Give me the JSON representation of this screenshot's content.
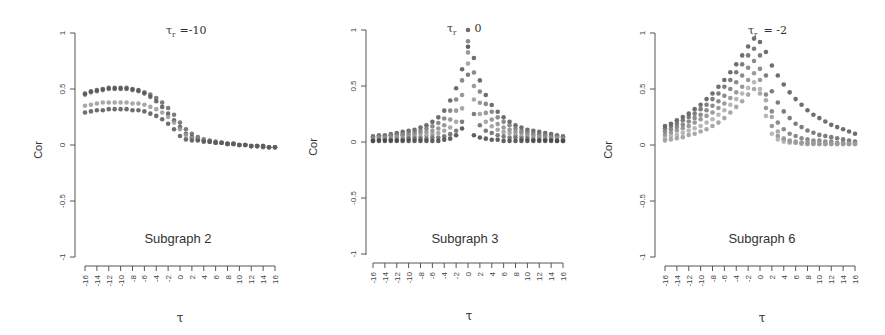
{
  "chart_data": [
    {
      "type": "scatter",
      "title": "τ_r = -10",
      "title_symbol": "τ",
      "title_subscript": "r",
      "title_value": "=-10",
      "subtitle": "Subgraph 2",
      "xlabel": "τ",
      "ylabel": "Cor",
      "xlim": [
        -16,
        16
      ],
      "ylim": [
        -1,
        1
      ],
      "x_ticks": [
        -16,
        -14,
        -12,
        -10,
        -8,
        -6,
        -4,
        -2,
        0,
        2,
        4,
        6,
        8,
        10,
        12,
        14,
        16
      ],
      "y_ticks": [
        -1,
        -0.5,
        0,
        0.5,
        1
      ],
      "y_tick_labels": [
        "-1",
        "-0.5",
        "0",
        "0.5",
        "1"
      ],
      "grid": false,
      "x": [
        -16,
        -15,
        -14,
        -13,
        -12,
        -11,
        -10,
        -9,
        -8,
        -7,
        -6,
        -5,
        -4,
        -3,
        -2,
        -1,
        0,
        1,
        2,
        3,
        4,
        5,
        6,
        7,
        8,
        9,
        10,
        11,
        12,
        13,
        14,
        15,
        16
      ],
      "series": [
        {
          "name": "upper",
          "color": "#666666",
          "values": [
            0.45,
            0.47,
            0.48,
            0.49,
            0.5,
            0.5,
            0.5,
            0.5,
            0.49,
            0.48,
            0.47,
            0.45,
            0.42,
            0.38,
            0.33,
            0.27,
            0.2,
            0.14,
            0.1,
            0.07,
            0.05,
            0.04,
            0.03,
            0.02,
            0.01,
            0.01,
            0.0,
            0.0,
            -0.01,
            -0.01,
            -0.01,
            -0.02,
            -0.02
          ]
        },
        {
          "name": "upper-2",
          "color": "#555555",
          "values": [
            0.46,
            0.48,
            0.49,
            0.5,
            0.51,
            0.51,
            0.51,
            0.51,
            0.5,
            0.49,
            0.46,
            0.43,
            0.39,
            0.34,
            0.28,
            0.22,
            0.16,
            0.1,
            0.07,
            0.05,
            0.04,
            0.03,
            0.02,
            0.02,
            0.01,
            0.01,
            0.0,
            0.0,
            -0.01,
            -0.01,
            -0.02,
            -0.02,
            -0.02
          ]
        },
        {
          "name": "middle",
          "color": "#999999",
          "values": [
            0.35,
            0.36,
            0.37,
            0.38,
            0.38,
            0.38,
            0.38,
            0.38,
            0.37,
            0.37,
            0.36,
            0.34,
            0.32,
            0.29,
            0.25,
            0.2,
            0.14,
            0.09,
            0.06,
            0.05,
            0.04,
            0.03,
            0.02,
            0.02,
            0.01,
            0.01,
            0.0,
            0.0,
            -0.01,
            -0.01,
            -0.01,
            -0.02,
            -0.02
          ]
        },
        {
          "name": "lower",
          "color": "#555555",
          "values": [
            0.29,
            0.3,
            0.31,
            0.31,
            0.32,
            0.32,
            0.32,
            0.32,
            0.31,
            0.31,
            0.3,
            0.28,
            0.26,
            0.23,
            0.19,
            0.14,
            0.08,
            0.05,
            0.04,
            0.04,
            0.03,
            0.03,
            0.02,
            0.02,
            0.01,
            0.01,
            0.0,
            0.0,
            -0.01,
            -0.01,
            -0.01,
            -0.02,
            -0.02
          ]
        }
      ]
    },
    {
      "type": "scatter",
      "title": "τ_r = 0",
      "title_symbol": "τ",
      "title_subscript": "r",
      "title_value": "0",
      "subtitle": "Subgraph 3",
      "xlabel": "τ",
      "ylabel": "Cor",
      "xlim": [
        -16,
        16
      ],
      "ylim": [
        -1,
        1
      ],
      "x_ticks": [
        -16,
        -14,
        -12,
        -10,
        -8,
        -6,
        -4,
        -2,
        0,
        2,
        4,
        6,
        8,
        10,
        12,
        14,
        16
      ],
      "y_ticks": [
        -1,
        -0.5,
        0,
        0.5,
        1
      ],
      "y_tick_labels": [
        "-1",
        "-0.5",
        "0",
        "0.5",
        "1"
      ],
      "grid": false,
      "x": [
        -16,
        -15,
        -14,
        -13,
        -12,
        -11,
        -10,
        -9,
        -8,
        -7,
        -6,
        -5,
        -4,
        -3,
        -2,
        -1,
        0,
        1,
        2,
        3,
        4,
        5,
        6,
        7,
        8,
        9,
        10,
        11,
        12,
        13,
        14,
        15,
        16
      ],
      "series": [
        {
          "name": "s1",
          "color": "#555555",
          "values": [
            0.05,
            0.06,
            0.06,
            0.07,
            0.08,
            0.09,
            0.1,
            0.11,
            0.13,
            0.15,
            0.18,
            0.22,
            0.28,
            0.37,
            0.48,
            0.65,
            1.0,
            0.75,
            0.55,
            0.42,
            0.33,
            0.27,
            0.22,
            0.18,
            0.15,
            0.13,
            0.11,
            0.1,
            0.09,
            0.08,
            0.07,
            0.06,
            0.05
          ]
        },
        {
          "name": "s2",
          "color": "#777777",
          "values": [
            0.04,
            0.05,
            0.05,
            0.06,
            0.07,
            0.07,
            0.08,
            0.09,
            0.1,
            0.12,
            0.14,
            0.17,
            0.21,
            0.28,
            0.38,
            0.55,
            0.9,
            0.62,
            0.45,
            0.34,
            0.27,
            0.22,
            0.18,
            0.15,
            0.12,
            0.1,
            0.09,
            0.08,
            0.07,
            0.06,
            0.05,
            0.05,
            0.04
          ]
        },
        {
          "name": "s3",
          "color": "#888888",
          "values": [
            0.03,
            0.04,
            0.04,
            0.05,
            0.05,
            0.06,
            0.06,
            0.07,
            0.08,
            0.09,
            0.1,
            0.12,
            0.15,
            0.2,
            0.28,
            0.42,
            0.8,
            0.5,
            0.35,
            0.26,
            0.2,
            0.16,
            0.13,
            0.11,
            0.09,
            0.08,
            0.07,
            0.06,
            0.05,
            0.05,
            0.04,
            0.04,
            0.03
          ]
        },
        {
          "name": "s4",
          "color": "#999999",
          "values": [
            0.02,
            0.03,
            0.03,
            0.03,
            0.04,
            0.04,
            0.04,
            0.05,
            0.05,
            0.06,
            0.07,
            0.08,
            0.1,
            0.13,
            0.18,
            0.3,
            0.7,
            0.38,
            0.25,
            0.18,
            0.14,
            0.11,
            0.09,
            0.08,
            0.06,
            0.05,
            0.05,
            0.04,
            0.04,
            0.03,
            0.03,
            0.03,
            0.02
          ]
        },
        {
          "name": "s5",
          "color": "#666666",
          "values": [
            0.01,
            0.02,
            0.02,
            0.02,
            0.02,
            0.02,
            0.03,
            0.03,
            0.03,
            0.03,
            0.04,
            0.04,
            0.05,
            0.07,
            0.1,
            0.18,
            0.6,
            0.25,
            0.15,
            0.1,
            0.08,
            0.06,
            0.05,
            0.04,
            0.04,
            0.03,
            0.03,
            0.02,
            0.02,
            0.02,
            0.02,
            0.01,
            0.01
          ]
        },
        {
          "name": "s6",
          "color": "#444444",
          "values": [
            0.01,
            0.01,
            0.01,
            0.01,
            0.01,
            0.01,
            0.01,
            0.01,
            0.01,
            0.01,
            0.01,
            0.01,
            0.02,
            0.03,
            0.06,
            0.12,
            0.85,
            0.06,
            0.04,
            0.03,
            0.02,
            0.02,
            0.01,
            0.01,
            0.01,
            0.01,
            0.01,
            0.01,
            0.01,
            0.01,
            0.01,
            0.01,
            0.01
          ]
        }
      ]
    },
    {
      "type": "scatter",
      "title": "τ_r = -2",
      "title_symbol": "τ",
      "title_subscript": "r",
      "title_value": "= -2",
      "subtitle": "Subgraph 6",
      "xlabel": "τ",
      "ylabel": "Cor",
      "xlim": [
        -16,
        16
      ],
      "ylim": [
        -1,
        1
      ],
      "x_ticks": [
        -16,
        -14,
        -12,
        -10,
        -8,
        -6,
        -4,
        -2,
        0,
        2,
        4,
        6,
        8,
        10,
        12,
        14,
        16
      ],
      "y_ticks": [
        -1,
        -0.5,
        0,
        0.5,
        1
      ],
      "y_tick_labels": [
        "-1",
        "-0.5",
        "0",
        "0.5",
        "1"
      ],
      "grid": false,
      "x": [
        -16,
        -15,
        -14,
        -13,
        -12,
        -11,
        -10,
        -9,
        -8,
        -7,
        -6,
        -5,
        -4,
        -3,
        -2,
        -1,
        0,
        1,
        2,
        3,
        4,
        5,
        6,
        7,
        8,
        9,
        10,
        11,
        12,
        13,
        14,
        15,
        16
      ],
      "series": [
        {
          "name": "s1",
          "color": "#555555",
          "values": [
            0.17,
            0.19,
            0.22,
            0.25,
            0.28,
            0.32,
            0.36,
            0.41,
            0.46,
            0.52,
            0.58,
            0.65,
            0.72,
            0.8,
            0.88,
            0.95,
            0.92,
            0.83,
            0.71,
            0.62,
            0.54,
            0.47,
            0.41,
            0.36,
            0.31,
            0.27,
            0.24,
            0.21,
            0.18,
            0.16,
            0.14,
            0.12,
            0.1
          ]
        },
        {
          "name": "s2",
          "color": "#666666",
          "values": [
            0.15,
            0.17,
            0.19,
            0.22,
            0.25,
            0.28,
            0.32,
            0.36,
            0.41,
            0.46,
            0.52,
            0.58,
            0.65,
            0.72,
            0.8,
            0.86,
            0.8,
            0.62,
            0.48,
            0.38,
            0.3,
            0.24,
            0.19,
            0.16,
            0.13,
            0.11,
            0.09,
            0.08,
            0.07,
            0.06,
            0.05,
            0.04,
            0.03
          ]
        },
        {
          "name": "s3",
          "color": "#777777",
          "values": [
            0.12,
            0.14,
            0.16,
            0.18,
            0.21,
            0.24,
            0.27,
            0.31,
            0.35,
            0.39,
            0.44,
            0.5,
            0.56,
            0.62,
            0.69,
            0.75,
            0.68,
            0.45,
            0.3,
            0.2,
            0.14,
            0.1,
            0.08,
            0.06,
            0.05,
            0.04,
            0.04,
            0.03,
            0.03,
            0.02,
            0.02,
            0.02,
            0.02
          ]
        },
        {
          "name": "s4",
          "color": "#888888",
          "values": [
            0.09,
            0.11,
            0.13,
            0.15,
            0.17,
            0.2,
            0.23,
            0.26,
            0.29,
            0.33,
            0.37,
            0.42,
            0.47,
            0.52,
            0.58,
            0.64,
            0.58,
            0.33,
            0.17,
            0.08,
            0.05,
            0.04,
            0.03,
            0.02,
            0.02,
            0.02,
            0.01,
            0.01,
            0.01,
            0.01,
            0.01,
            0.01,
            0.01
          ]
        },
        {
          "name": "s5",
          "color": "#aaaaaa",
          "values": [
            0.06,
            0.08,
            0.09,
            0.11,
            0.13,
            0.15,
            0.17,
            0.2,
            0.23,
            0.27,
            0.31,
            0.36,
            0.41,
            0.46,
            0.51,
            0.56,
            0.5,
            0.26,
            0.1,
            0.05,
            0.03,
            0.02,
            0.02,
            0.01,
            0.01,
            0.01,
            0.01,
            0.01,
            0.01,
            0.01,
            0.01,
            0.01,
            0.01
          ]
        },
        {
          "name": "s6",
          "color": "#999999",
          "values": [
            0.04,
            0.05,
            0.06,
            0.07,
            0.09,
            0.1,
            0.12,
            0.14,
            0.17,
            0.2,
            0.24,
            0.29,
            0.34,
            0.39,
            0.45,
            0.5,
            0.46,
            0.4,
            0.25,
            0.12,
            0.06,
            0.03,
            0.02,
            0.02,
            0.01,
            0.01,
            0.01,
            0.01,
            0.01,
            0.01,
            0.01,
            0.01,
            0.01
          ]
        }
      ]
    }
  ],
  "panels": [
    {
      "title_symbol": "τ",
      "title_subscript": "r",
      "title_value": "=-10",
      "ylabel": "Cor",
      "xlabel": "τ",
      "subtitle": "Subgraph 2"
    },
    {
      "title_symbol": "τ",
      "title_subscript": "r",
      "title_value": "0",
      "ylabel": "Cor",
      "xlabel": "τ",
      "subtitle": "Subgraph 3"
    },
    {
      "title_symbol": "τ",
      "title_subscript": "r",
      "title_value": "= -2",
      "ylabel": "Cor",
      "xlabel": "τ",
      "subtitle": "Subgraph 6"
    }
  ]
}
